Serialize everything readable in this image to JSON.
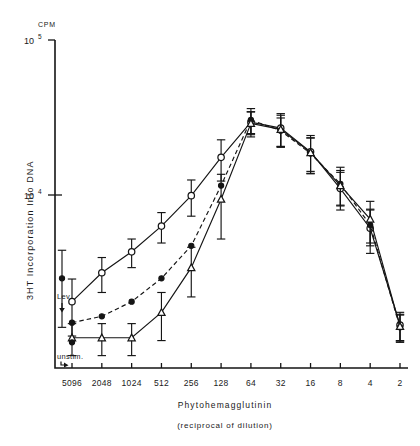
{
  "chart_data": {
    "type": "line",
    "title": "",
    "xlabel": "Phytohemagglutinin",
    "xlabel_sub": "(reciprocal of dilution)",
    "ylabel": "3HT Incorporation Into DNA",
    "y_unit": "CPM",
    "y_scale": "log",
    "ylim": [
      1000,
      100000
    ],
    "y_ticks": [
      {
        "label": "10",
        "exponent": "5",
        "value": 100000
      },
      {
        "label": "10",
        "exponent": "4",
        "value": 10000
      }
    ],
    "categories": [
      "5096",
      "2048",
      "1024",
      "512",
      "256",
      "128",
      "64",
      "32",
      "16",
      "8",
      "4",
      "2"
    ],
    "x_note": "axis is reversed: highest dilution at left",
    "legend_position": "none",
    "grid": false,
    "series": [
      {
        "name": "open-circle-series",
        "marker": "open-circle",
        "line_style": "solid",
        "values": [
          2050,
          3150,
          4300,
          6300,
          9900,
          17500,
          29500,
          27000,
          19000,
          11000,
          6100,
          1450
        ],
        "errors": [
          820,
          800,
          900,
          1400,
          2600,
          5200,
          5000,
          6500,
          5200,
          3000,
          1900,
          300
        ]
      },
      {
        "name": "filled-circle-series",
        "marker": "filled-circle",
        "line_style": "dashed",
        "values": [
          1500,
          1650,
          2050,
          2900,
          4700,
          11500,
          30500,
          26000,
          18500,
          11800,
          6400,
          1400
        ],
        "errors": [
          0,
          0,
          0,
          0,
          0,
          0,
          5600,
          5400,
          4800,
          3300,
          1700,
          280
        ]
      },
      {
        "name": "triangle-series",
        "marker": "triangle",
        "line_style": "solid",
        "values": [
          1200,
          1200,
          1200,
          1750,
          3400,
          9400,
          29000,
          26500,
          18800,
          11500,
          7000,
          1420
        ],
        "errors": [
          280,
          280,
          280,
          600,
          1200,
          4200,
          5300,
          6200,
          4600,
          2900,
          2100,
          280
        ]
      }
    ],
    "annotations": [
      {
        "name": "lev-point",
        "label": "Lev.",
        "marker": "filled-circle",
        "value": 2900,
        "error": 1500,
        "arrow": "down"
      },
      {
        "name": "unstim-point",
        "label": "unstim.",
        "marker": "filled-circle",
        "value": 1120,
        "error": 0,
        "arrow": "down"
      }
    ]
  }
}
